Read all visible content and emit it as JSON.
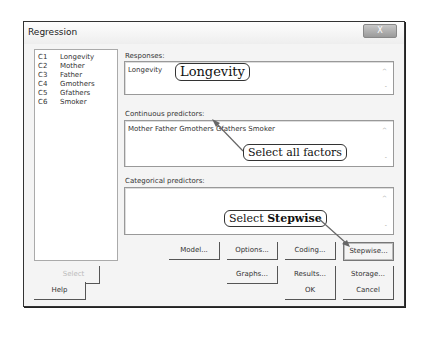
{
  "window": {
    "title": "Regression",
    "close_label": "X"
  },
  "variables": [
    {
      "id": "C1",
      "name": "Longevity"
    },
    {
      "id": "C2",
      "name": "Mother"
    },
    {
      "id": "C3",
      "name": "Father"
    },
    {
      "id": "C4",
      "name": "Gmothers"
    },
    {
      "id": "C5",
      "name": "Gfathers"
    },
    {
      "id": "C6",
      "name": "Smoker"
    }
  ],
  "responses": {
    "label": "Responses:",
    "value": "Longevity"
  },
  "continuous": {
    "label": "Continuous predictors:",
    "value": "Mother Father Gmothers Gfathers Smoker"
  },
  "categorical": {
    "label": "Categorical predictors:",
    "value": ""
  },
  "buttons": {
    "select": "Select",
    "help": "Help",
    "model": "Model...",
    "options": "Options...",
    "coding": "Coding...",
    "stepwise": "Stepwise...",
    "graphs": "Graphs...",
    "results": "Results...",
    "storage": "Storage...",
    "ok": "OK",
    "cancel": "Cancel"
  },
  "annotations": {
    "longevity": "Longevity",
    "factors": "Select all factors",
    "stepwise_prefix": "Select ",
    "stepwise_bold": "Stepwise"
  }
}
